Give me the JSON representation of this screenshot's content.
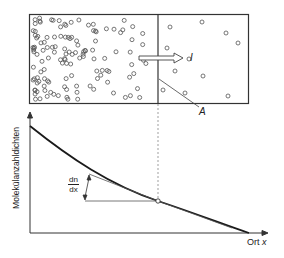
{
  "diagram": {
    "type": "diffusion-illustration",
    "container": {
      "left_region": "high molecule density",
      "right_region": "low molecule density",
      "divider_label": "A"
    },
    "flux_arrow": {
      "label": "I",
      "direction": "right"
    },
    "graph": {
      "y_axis_label": "Molekülanzahldichten",
      "x_axis_label": "Ort",
      "x_axis_var": "x",
      "curve": "decreasing convex concentration profile",
      "tangent_label": {
        "numerator": "dn",
        "denominator": "dx"
      }
    },
    "colors": {
      "line": "#222222",
      "molecule": "#555555",
      "dashed": "#777777"
    }
  }
}
